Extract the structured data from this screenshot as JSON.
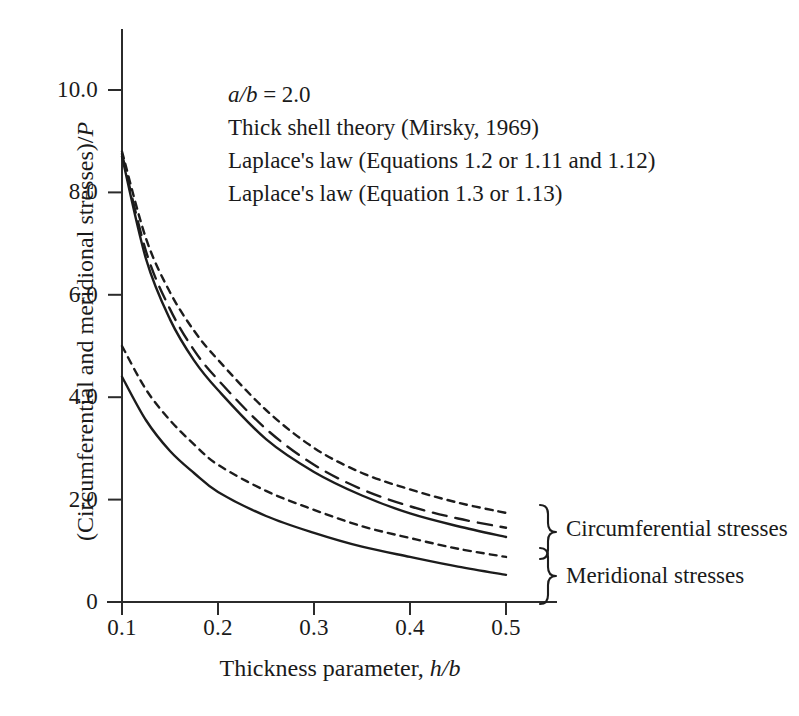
{
  "chart_data": {
    "type": "line",
    "title": "",
    "xlabel": "Thickness parameter, h/b",
    "ylabel": "(Circumferential and meridional stresses)/P",
    "xlim": [
      0.1,
      0.5
    ],
    "ylim": [
      0,
      10.0
    ],
    "grid": false,
    "legend_position": "upper-left-inside",
    "xticks": [
      "0.1",
      "0.2",
      "0.3",
      "0.4",
      "0.5"
    ],
    "xtick_values": [
      0.1,
      0.2,
      0.3,
      0.4,
      0.5
    ],
    "yticks": [
      "0",
      "2.0",
      "4.0",
      "6.0",
      "8.0",
      "10.0"
    ],
    "ytick_values": [
      0,
      2.0,
      4.0,
      6.0,
      8.0,
      10.0
    ],
    "x": [
      0.1,
      0.125,
      0.15,
      0.175,
      0.2,
      0.25,
      0.3,
      0.35,
      0.4,
      0.45,
      0.5
    ],
    "series": [
      {
        "name": "Circumferential — Laplace's law (Equations 1.2 or 1.11 and 1.12)",
        "group": "Circumferential stresses",
        "style": "shortdash",
        "values": [
          8.8,
          7.1,
          6.05,
          5.3,
          4.73,
          3.75,
          3.01,
          2.52,
          2.2,
          1.94,
          1.74
        ]
      },
      {
        "name": "Circumferential — Thick shell theory (Mirsky, 1969)",
        "group": "Circumferential stresses",
        "style": "longdash",
        "values": [
          8.75,
          6.85,
          5.72,
          4.92,
          4.34,
          3.38,
          2.68,
          2.2,
          1.87,
          1.63,
          1.45
        ]
      },
      {
        "name": "Circumferential — Laplace's law (Equation 1.3 or 1.13)",
        "group": "Circumferential stresses",
        "style": "solid",
        "values": [
          8.7,
          6.7,
          5.52,
          4.72,
          4.14,
          3.18,
          2.54,
          2.08,
          1.73,
          1.48,
          1.27
        ]
      },
      {
        "name": "Meridional — Laplace's law (Equations 1.2 or 1.11 and 1.12)",
        "group": "Meridional stresses",
        "style": "shortdash",
        "values": [
          5.0,
          4.15,
          3.55,
          3.08,
          2.68,
          2.17,
          1.8,
          1.48,
          1.25,
          1.04,
          0.88
        ]
      },
      {
        "name": "Meridional — Laplace's law (Equation 1.3 or 1.13)",
        "group": "Meridional stresses",
        "style": "solid",
        "values": [
          4.4,
          3.55,
          2.95,
          2.52,
          2.15,
          1.68,
          1.35,
          1.08,
          0.88,
          0.69,
          0.53
        ]
      }
    ],
    "annotations": [
      {
        "text": "Circumferential stresses",
        "at_y": 1.5
      },
      {
        "text": "Meridional stresses",
        "at_y": 0.7
      }
    ]
  },
  "legend": {
    "lines": [
      {
        "prefix_italic": "a/b",
        "rest": " = 2.0"
      },
      {
        "prefix_italic": "",
        "rest": "Thick shell theory (Mirsky, 1969)"
      },
      {
        "prefix_italic": "",
        "rest": "Laplace's law (Equations 1.2 or 1.11 and 1.12)"
      },
      {
        "prefix_italic": "",
        "rest": "Laplace's law (Equation 1.3 or 1.13)"
      }
    ]
  },
  "axis_text": {
    "ylabel_main": "(Circumferential and meridional stresses)/",
    "ylabel_italic": "P",
    "xlabel_main": "Thickness parameter, ",
    "xlabel_italic": "h/b"
  },
  "annotations_text": {
    "circumferential": "Circumferential stresses",
    "meridional": "Meridional stresses"
  },
  "colors": {
    "ink": "#1c1c1c",
    "background": "#ffffff"
  }
}
